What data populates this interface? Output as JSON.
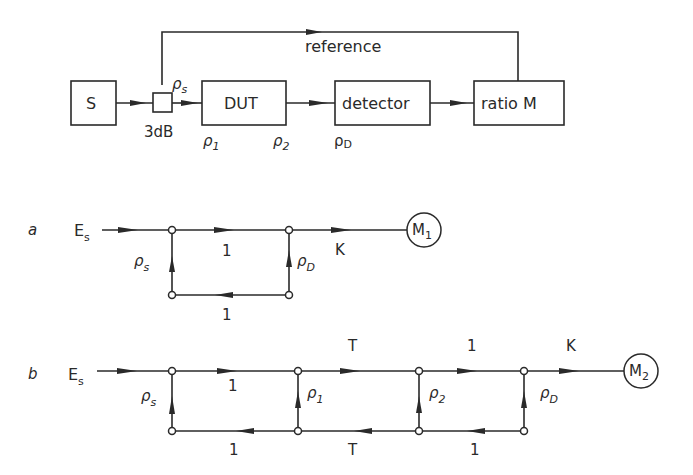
{
  "block_diagram": {
    "source_label": "S",
    "coupler_label": "3dB",
    "coupler_reflection": {
      "sym": "ρ",
      "sub": "s"
    },
    "dut_label": "DUT",
    "detector_label": "detector",
    "ratio_label": "ratio M",
    "reference_label": "reference",
    "rho1": {
      "sym": "ρ",
      "sub": "1"
    },
    "rho2": {
      "sym": "ρ",
      "sub": "2"
    },
    "rhoD": {
      "sym": "ρ",
      "sub": "D"
    }
  },
  "graph_a": {
    "label": "a",
    "source": {
      "sym": "E",
      "sub": "s"
    },
    "rho_s": {
      "sym": "ρ",
      "sub": "s"
    },
    "rho_D": {
      "sym": "ρ",
      "sub": "D"
    },
    "top_branch": "1",
    "bottom_branch": "1",
    "k_branch": "K",
    "meter": {
      "sym": "M",
      "sub": "1"
    }
  },
  "graph_b": {
    "label": "b",
    "source": {
      "sym": "E",
      "sub": "s"
    },
    "rho_s": {
      "sym": "ρ",
      "sub": "s"
    },
    "rho_1": {
      "sym": "ρ",
      "sub": "1"
    },
    "rho_2": {
      "sym": "ρ",
      "sub": "2"
    },
    "rho_D": {
      "sym": "ρ",
      "sub": "D"
    },
    "top_branches": [
      "1",
      "T",
      "1",
      "K"
    ],
    "bottom_branches": [
      "1",
      "T",
      "1"
    ],
    "meter": {
      "sym": "M",
      "sub": "2"
    }
  }
}
